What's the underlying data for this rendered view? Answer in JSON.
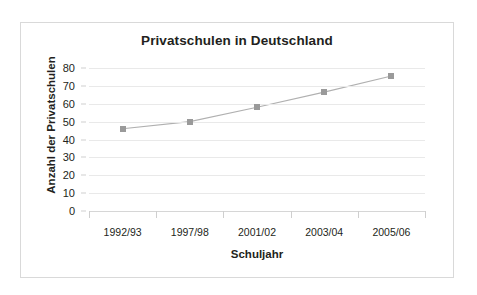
{
  "top_strip": {
    "ghost_text": " "
  },
  "chart_data": {
    "type": "line",
    "title": "Privatschulen in Deutschland",
    "xlabel": "Schuljahr",
    "ylabel": "Anzahl der Privatschulen",
    "categories": [
      "1992/93",
      "1997/98",
      "2001/02",
      "2003/04",
      "2005/06"
    ],
    "values": [
      46,
      50,
      58,
      66.5,
      75.5
    ],
    "ylim": [
      0,
      80
    ],
    "ytick_labels": [
      "80",
      "70",
      "60",
      "50",
      "40",
      "30",
      "20",
      "10",
      "0"
    ],
    "ytick_values": [
      80,
      70,
      60,
      50,
      40,
      30,
      20,
      10,
      0
    ],
    "ytick_step": 10,
    "grid": true,
    "legend": "none",
    "series": [
      {
        "name": "Anzahl der Privatschulen",
        "values": [
          46,
          50,
          58,
          66.5,
          75.5
        ],
        "line_color": "#b0b0b0",
        "marker_color": "#9a9a9a",
        "marker": "square"
      }
    ],
    "colors": {
      "line": "#b0b0b0",
      "marker": "#9a9a9a",
      "gridline": "#e9e9e9",
      "axis": "#d6d6d6",
      "text": "#231f20",
      "card_border": "#d9d9d9",
      "background": "#ffffff"
    }
  }
}
